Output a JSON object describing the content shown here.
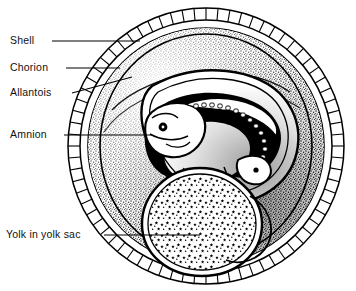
{
  "figure": {
    "background_color": "#ffffff",
    "ink_color": "#000000",
    "view_box": "0 0 356 291"
  },
  "egg": {
    "center_x": 206,
    "center_y": 146,
    "shell_outer_radius": 138,
    "shell_inner_radius": 126,
    "shell_segment_count": 72,
    "shell_label": "Shell",
    "chorion_radius": 118,
    "chorion_label": "Chorion",
    "allantois_label": "Allantois",
    "amnion_label": "Amnion",
    "yolk_label": "Yolk in yolk sac"
  },
  "labels": [
    {
      "id": "shell",
      "text": "Shell",
      "x": 10,
      "y": 34,
      "leader_from_x": 52,
      "leader_from_y": 41,
      "leader_to_x": 140,
      "leader_to_y": 41
    },
    {
      "id": "chorion",
      "text": "Chorion",
      "x": 10,
      "y": 61,
      "leader_from_x": 66,
      "leader_from_y": 68,
      "leader_to_x": 120,
      "leader_to_y": 68
    },
    {
      "id": "allantois",
      "text": "Allantois",
      "x": 10,
      "y": 86,
      "leader_from_x": 72,
      "leader_from_y": 93,
      "leader_to_x": 132,
      "leader_to_y": 77
    },
    {
      "id": "amnion",
      "text": "Amnion",
      "x": 10,
      "y": 128,
      "leader_from_x": 64,
      "leader_from_y": 135,
      "leader_to_x": 152,
      "leader_to_y": 135
    },
    {
      "id": "yolk",
      "text": "Yolk in yolk sac",
      "x": 6,
      "y": 228,
      "leader_from_x": 104,
      "leader_from_y": 235,
      "leader_to_x": 200,
      "leader_to_y": 235
    }
  ],
  "embryo": {
    "description": "curled chick embryo with head, eye, somites and tail",
    "eye_center_x": 163,
    "eye_center_y": 127,
    "eye_radius": 4.2
  },
  "yolk_sac": {
    "description": "large rounded yolk mass with stellate stipple texture",
    "center_x": 200,
    "center_y": 218
  }
}
